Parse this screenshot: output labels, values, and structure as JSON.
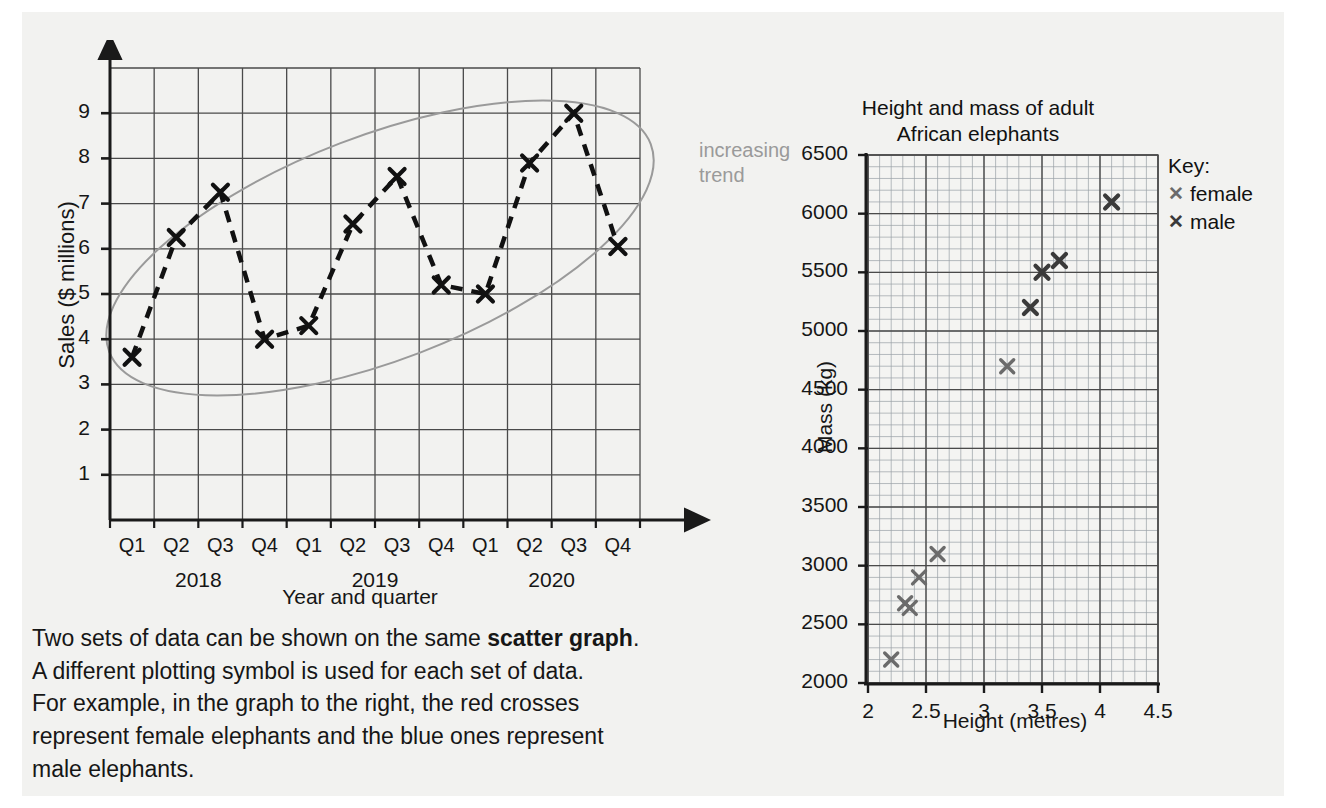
{
  "colors": {
    "page_background": "#ffffff",
    "panel_background": "#f2f2f0",
    "axis": "#1a1a1a",
    "grid_major": "#4a4a4a",
    "grid_minor": "#9aa0a6",
    "marker_dark": "#111111",
    "trend_ellipse": "#9a9a9a",
    "trend_label": "#9a9a9a",
    "female_marker": "#6b6b6b",
    "male_marker": "#3a3a3a"
  },
  "line_chart": {
    "annotation": "increasing\ntrend",
    "chart_data": {
      "type": "line",
      "title": "",
      "xlabel": "Year and quarter",
      "ylabel": "Sales ($ millions)",
      "ylim": [
        0,
        10
      ],
      "yticks": [
        "1",
        "2",
        "3",
        "4",
        "5",
        "6",
        "7",
        "8",
        "9"
      ],
      "grid": true,
      "categories": [
        "Q1",
        "Q2",
        "Q3",
        "Q4",
        "Q1",
        "Q2",
        "Q3",
        "Q4",
        "Q1",
        "Q2",
        "Q3",
        "Q4"
      ],
      "group_labels": [
        "2018",
        "2019",
        "2020"
      ],
      "values": [
        3.6,
        6.25,
        7.25,
        4.0,
        4.3,
        6.55,
        7.6,
        5.2,
        5.0,
        7.9,
        9.0,
        6.05
      ],
      "marker": "x",
      "line_style": "dashed",
      "annotations": [
        "increasing trend"
      ]
    }
  },
  "scatter_chart": {
    "key_title": "Key:",
    "chart_data": {
      "type": "scatter",
      "title": "Height and mass of adult African elephants",
      "title_line1": "Height and mass of adult",
      "title_line2": "African elephants",
      "xlabel": "Height (metres)",
      "ylabel": "Mass (kg)",
      "xlim": [
        2,
        4.5
      ],
      "ylim": [
        2000,
        6500
      ],
      "xticks": [
        "2",
        "2.5",
        "3",
        "3.5",
        "4",
        "4.5"
      ],
      "yticks": [
        "2000",
        "2500",
        "3000",
        "3500",
        "4000",
        "4500",
        "5000",
        "5500",
        "6000",
        "6500"
      ],
      "grid": true,
      "legend_position": "right",
      "series": [
        {
          "name": "female",
          "marker": "x",
          "color": "#6b6b6b",
          "points": [
            {
              "x": 2.2,
              "y": 2200
            },
            {
              "x": 2.32,
              "y": 2680
            },
            {
              "x": 2.36,
              "y": 2640
            },
            {
              "x": 2.44,
              "y": 2900
            },
            {
              "x": 2.6,
              "y": 3100
            },
            {
              "x": 3.2,
              "y": 4700
            }
          ]
        },
        {
          "name": "male",
          "marker": "x",
          "color": "#3a3a3a",
          "points": [
            {
              "x": 3.4,
              "y": 5200
            },
            {
              "x": 3.5,
              "y": 5500
            },
            {
              "x": 3.65,
              "y": 5600
            },
            {
              "x": 4.1,
              "y": 6100
            }
          ]
        }
      ]
    }
  },
  "body_text": {
    "line1_a": "Two sets of data can be shown on the same ",
    "line1_b": "scatter graph",
    "line1_c": ".",
    "line2": "A different plotting symbol is used for each set of data.",
    "line3": "For example, in the graph to the right, the red crosses",
    "line4": "represent female elephants and the blue ones represent",
    "line5": "male elephants."
  }
}
